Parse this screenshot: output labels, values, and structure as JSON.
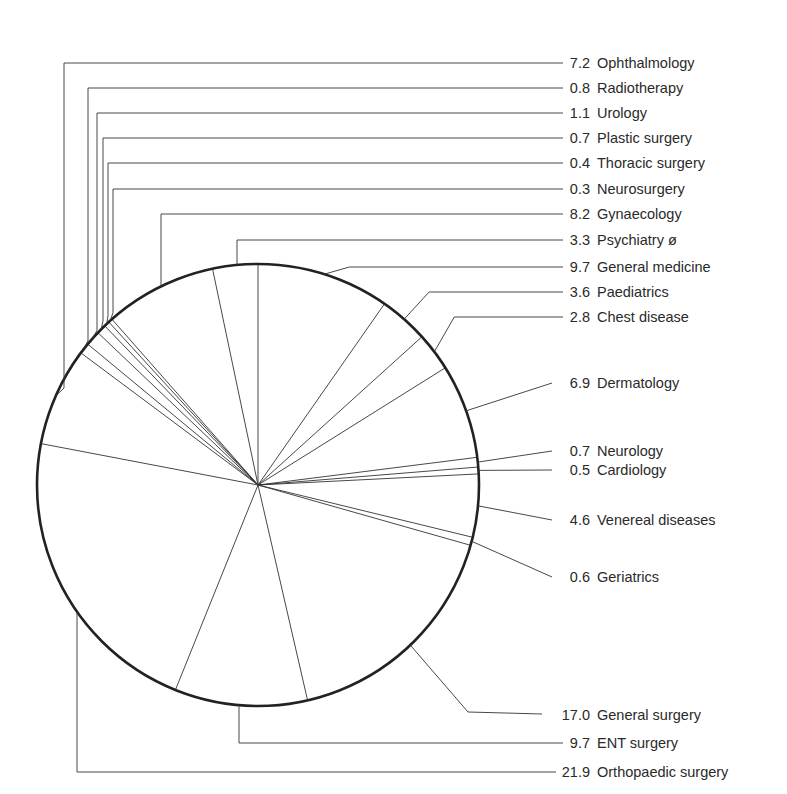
{
  "chart_data": {
    "type": "pie",
    "title": "",
    "unit": "%",
    "start_angle": "12 o'clock",
    "direction": "clockwise",
    "slices": [
      {
        "label": "General medicine",
        "value": 9.7
      },
      {
        "label": "Paediatrics",
        "value": 3.6
      },
      {
        "label": "Chest disease",
        "value": 2.8
      },
      {
        "label": "Dermatology",
        "value": 6.9
      },
      {
        "label": "Neurology",
        "value": 0.7
      },
      {
        "label": "Cardiology",
        "value": 0.5
      },
      {
        "label": "Venereal diseases",
        "value": 4.6
      },
      {
        "label": "Geriatrics",
        "value": 0.6
      },
      {
        "label": "General surgery",
        "value": 17.0
      },
      {
        "label": "ENT surgery",
        "value": 9.7
      },
      {
        "label": "Orthopaedic surgery",
        "value": 21.9
      },
      {
        "label": "Ophthalmology",
        "value": 7.2
      },
      {
        "label": "Radiotherapy",
        "value": 0.8
      },
      {
        "label": "Urology",
        "value": 1.1
      },
      {
        "label": "Plastic surgery",
        "value": 0.7
      },
      {
        "label": "Thoracic surgery",
        "value": 0.4
      },
      {
        "label": "Neurosurgery",
        "value": 0.3
      },
      {
        "label": "Gynaecology",
        "value": 8.2
      },
      {
        "label": "Psychiatry ø",
        "value": 3.3
      }
    ],
    "legend_order": [
      "Ophthalmology",
      "Radiotherapy",
      "Urology",
      "Plastic surgery",
      "Thoracic surgery",
      "Neurosurgery",
      "Gynaecology",
      "Psychiatry ø",
      "General medicine",
      "Paediatrics",
      "Chest disease",
      "Dermatology",
      "Neurology",
      "Cardiology",
      "Venereal diseases",
      "Geriatrics",
      "General surgery",
      "ENT surgery",
      "Orthopaedic surgery"
    ],
    "legend_position": "right, leader lines",
    "grid": false
  },
  "labels": [
    {
      "value": "7.2",
      "text": "Ophthalmology",
      "y": 63
    },
    {
      "value": "0.8",
      "text": "Radiotherapy",
      "y": 88
    },
    {
      "value": "1.1",
      "text": "Urology",
      "y": 113
    },
    {
      "value": "0.7",
      "text": "Plastic surgery",
      "y": 138
    },
    {
      "value": "0.4",
      "text": "Thoracic surgery",
      "y": 163
    },
    {
      "value": "0.3",
      "text": "Neurosurgery",
      "y": 189
    },
    {
      "value": "8.2",
      "text": "Gynaecology",
      "y": 214
    },
    {
      "value": "3.3",
      "text": "Psychiatry ø",
      "y": 240
    },
    {
      "value": "9.7",
      "text": "General medicine",
      "y": 267
    },
    {
      "value": "3.6",
      "text": "Paediatrics",
      "y": 292
    },
    {
      "value": "2.8",
      "text": "Chest disease",
      "y": 317
    },
    {
      "value": "6.9",
      "text": "Dermatology",
      "y": 383
    },
    {
      "value": "0.7",
      "text": "Neurology",
      "y": 451
    },
    {
      "value": "0.5",
      "text": "Cardiology",
      "y": 470
    },
    {
      "value": "4.6",
      "text": "Venereal diseases",
      "y": 520
    },
    {
      "value": "0.6",
      "text": "Geriatrics",
      "y": 577
    },
    {
      "value": "17.0",
      "text": "General surgery",
      "y": 715
    },
    {
      "value": "9.7",
      "text": "ENT surgery",
      "y": 743
    },
    {
      "value": "21.9",
      "text": "Orthopaedic surgery",
      "y": 772
    }
  ],
  "style": {
    "stroke": "#333333",
    "outline": "#222222",
    "text": "#2a2a2a",
    "background": "#ffffff"
  }
}
